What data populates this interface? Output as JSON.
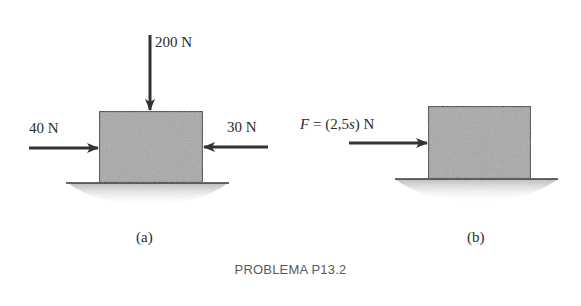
{
  "figure": {
    "caption": "PROBLEMA P13.2",
    "part_a": {
      "label": "(a)",
      "forces": {
        "top": "200 N",
        "left": "40 N",
        "right": "30 N"
      }
    },
    "part_b": {
      "label": "(b)",
      "force_label_var": "F",
      "force_label_rest": " = (2,5",
      "force_label_s": "s",
      "force_label_end": ") N"
    },
    "colors": {
      "block_fill": "#a8a8a8",
      "block_edge": "#3a3a3a",
      "arrow": "#333333",
      "ground_line": "#3a3a3a",
      "ground_shadow": "#c4c4c4",
      "caption_text": "#5a5a5a"
    }
  }
}
